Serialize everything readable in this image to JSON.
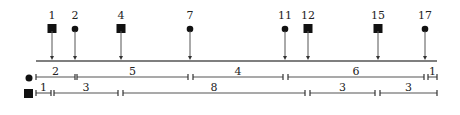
{
  "diagram": {
    "axis": {
      "x_start": 36,
      "x_end": 437,
      "y": 61
    },
    "events": [
      {
        "label": "1",
        "shape": "square",
        "x": 52
      },
      {
        "label": "2",
        "shape": "circle",
        "x": 75
      },
      {
        "label": "4",
        "shape": "square",
        "x": 121
      },
      {
        "label": "7",
        "shape": "circle",
        "x": 190
      },
      {
        "label": "11",
        "shape": "circle",
        "x": 285
      },
      {
        "label": "12",
        "shape": "square",
        "x": 308
      },
      {
        "label": "15",
        "shape": "square",
        "x": 378
      },
      {
        "label": "17",
        "shape": "circle",
        "x": 425
      }
    ],
    "rows": [
      {
        "name": "circle",
        "y": 77,
        "segments": [
          {
            "label": "2",
            "x1": 36,
            "x2": 75
          },
          {
            "label": "5",
            "x1": 77,
            "x2": 188
          },
          {
            "label": "4",
            "x1": 193,
            "x2": 283
          },
          {
            "label": "6",
            "x1": 288,
            "x2": 424
          },
          {
            "label": "1",
            "x1": 428,
            "x2": 437
          }
        ]
      },
      {
        "name": "square",
        "y": 93,
        "segments": [
          {
            "label": "1",
            "x1": 36,
            "x2": 51
          },
          {
            "label": "3",
            "x1": 54,
            "x2": 118
          },
          {
            "label": "8",
            "x1": 123,
            "x2": 305
          },
          {
            "label": "3",
            "x1": 310,
            "x2": 375
          },
          {
            "label": "3",
            "x1": 380,
            "x2": 437
          }
        ]
      }
    ]
  }
}
